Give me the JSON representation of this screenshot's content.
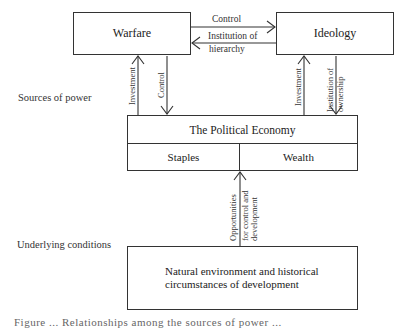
{
  "side_labels": {
    "sources": "Sources of power",
    "underlying": "Underlying conditions"
  },
  "boxes": {
    "warfare": "Warfare",
    "ideology": "Ideology",
    "political_economy": "The Political Economy",
    "staples": "Staples",
    "wealth": "Wealth",
    "natural_line1": "Natural environment and historical",
    "natural_line2": "circumstances of development"
  },
  "arrows": {
    "warfare_to_ideology": "Control",
    "ideology_to_warfare_line1": "Institution of",
    "ideology_to_warfare_line2": "hierarchy",
    "warfare_investment": "Investment",
    "warfare_control": "Control",
    "ideology_investment": "Investment",
    "ideology_ownership_line1": "Institution of",
    "ideology_ownership_line2": "ownership",
    "opportunities_line1": "Opportunities",
    "opportunities_line2": "for control and",
    "opportunities_line3": "development"
  },
  "caption": "Figure ... Relationships among the sources of power ..."
}
